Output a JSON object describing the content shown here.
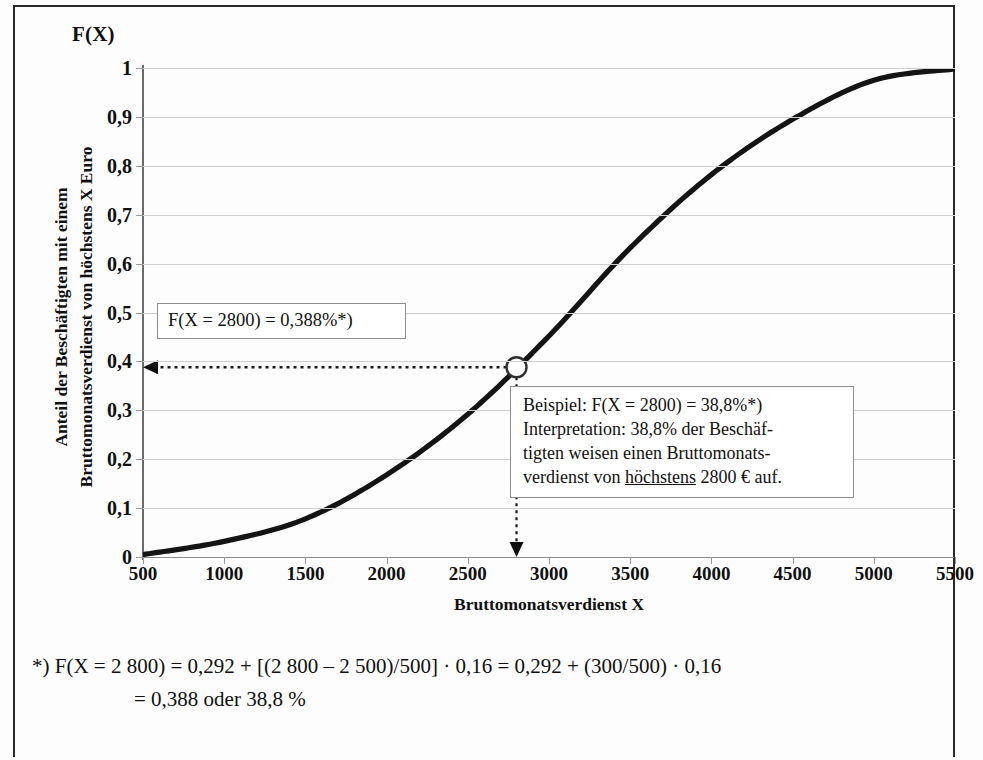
{
  "figure": {
    "y_axis_title": "F(X)",
    "y_caption_line1": "Anteil der Beschäftigten mit einem",
    "y_caption_line2": "Bruttomonatsverdienst von höchstens X Euro",
    "x_caption": "Bruttomonatsverdienst X"
  },
  "callouts": {
    "value_box": "F(X = 2800) = 0,388%*)",
    "example_line1": "Beispiel: F(X = 2800)  =  38,8%*)",
    "example_line2": "Interpretation: 38,8% der Beschäf-",
    "example_line3": "tigten weisen einen Bruttomonats-",
    "example_line4_a": "verdienst von ",
    "example_line4_b": "höchstens",
    "example_line4_c": " 2800 € auf."
  },
  "footnote": {
    "marker": "*)",
    "line1": "F(X = 2 800)  = 0,292 + [(2 800 – 2 500)/500] · 0,16 = 0,292 + (300/500) · 0,16",
    "line2": "= 0,388 oder 38,8 %"
  },
  "chart_data": {
    "type": "line",
    "xlabel": "Bruttomonatsverdienst X",
    "ylabel": "Anteil der Beschäftigten mit einem Bruttomonatsverdienst von höchstens X Euro",
    "y_axis_title": "F(X)",
    "xlim": [
      500,
      5500
    ],
    "ylim": [
      0,
      1
    ],
    "xticks": [
      500,
      1000,
      1500,
      2000,
      2500,
      3000,
      3500,
      4000,
      4500,
      5000,
      5500
    ],
    "xtick_labels": [
      "500",
      "1000",
      "1500",
      "2000",
      "2500",
      "3000",
      "3500",
      "4000",
      "4500",
      "5000",
      "5500"
    ],
    "yticks": [
      0,
      0.1,
      0.2,
      0.3,
      0.4,
      0.5,
      0.6,
      0.7,
      0.8,
      0.9,
      1
    ],
    "ytick_labels": [
      "0",
      "0,1",
      "0,2",
      "0,3",
      "0,4",
      "0,5",
      "0,6",
      "0,7",
      "0,8",
      "0,9",
      "1"
    ],
    "grid": "horizontal",
    "legend": "none",
    "series": [
      {
        "name": "F(X)",
        "color": "#141414",
        "x": [
          500,
          1000,
          1500,
          2000,
          2500,
          3000,
          3500,
          4000,
          4500,
          5000,
          5500
        ],
        "values": [
          0.005,
          0.032,
          0.078,
          0.168,
          0.292,
          0.452,
          0.632,
          0.782,
          0.895,
          0.975,
          0.998
        ]
      }
    ],
    "highlight_point": {
      "label": "F(X = 2800)",
      "x": 2800,
      "y": 0.388,
      "y_percent": "38,8%",
      "marker": "open-circle"
    },
    "annotations": [
      "F(X = 2800) = 0,388%*)",
      "Beispiel: F(X = 2800)  =  38,8%*)",
      "Interpretation: 38,8% der Beschäftigten weisen einen Bruttomonatsverdienst von höchstens 2800 € auf."
    ]
  }
}
